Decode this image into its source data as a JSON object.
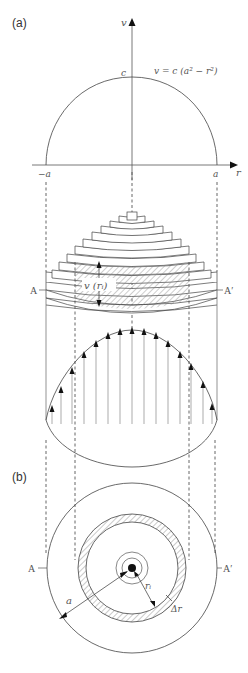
{
  "panel_a": {
    "label": "(a)",
    "y_axis_label": "v",
    "x_axis_label": "r",
    "equation": "v = c (a² − r²)",
    "peak_label": "c",
    "neg_a_label": "−a",
    "pos_a_label": "a",
    "section_left": "A",
    "section_right": "A′",
    "velocity_label": "v (rᵢ)"
  },
  "panel_b": {
    "label": "(b)",
    "section_left": "A",
    "section_right": "A′",
    "radius_label": "a",
    "ring_radius_label": "rᵢ",
    "ring_width_label": "Δr"
  },
  "colors": {
    "line": "#444444",
    "hatch": "#666666",
    "text": "#555555"
  }
}
